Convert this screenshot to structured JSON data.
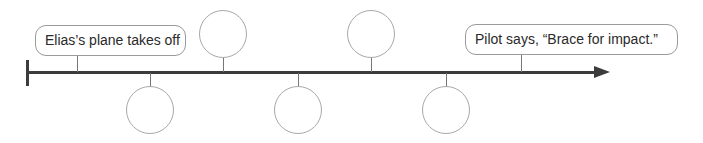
{
  "timeline": {
    "events": [
      {
        "label": "Elias's plane takes off",
        "position": "start",
        "kind": "text-box"
      },
      {
        "label": "",
        "position": "below",
        "kind": "blank-circle"
      },
      {
        "label": "",
        "position": "above",
        "kind": "blank-circle"
      },
      {
        "label": "",
        "position": "below",
        "kind": "blank-circle"
      },
      {
        "label": "",
        "position": "above",
        "kind": "blank-circle"
      },
      {
        "label": "",
        "position": "below",
        "kind": "blank-circle"
      },
      {
        "label": "Pilot says, “Brace for impact.”",
        "position": "end",
        "kind": "text-box"
      }
    ],
    "start_label": "Elias’s plane takes off",
    "end_label": "Pilot says, “Brace for impact.”",
    "blank_circle_count": 5,
    "direction": "left-to-right",
    "colors": {
      "line": "#3c3c3c",
      "box_border": "#9a9a9a",
      "circle_border": "#a8a8a8",
      "text": "#2a2a2a"
    }
  }
}
